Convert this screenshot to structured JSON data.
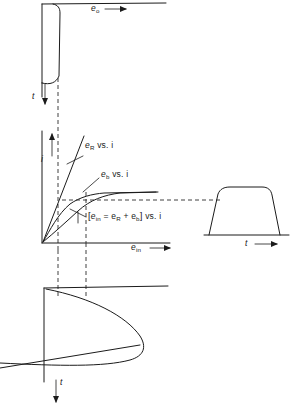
{
  "figure": {
    "background_color": "#ffffff",
    "ink_color": "#1b1b1b"
  },
  "panels": {
    "top_left": {
      "name": "output-voltage-waveform-panel",
      "description": "Flat-topped pulse waveform plotted with voltage to the right and time downward",
      "horizontal_axis_label": "e",
      "horizontal_axis_subscript": "o",
      "horizontal_axis_arrow": "right",
      "vertical_axis_label": "t",
      "vertical_axis_arrow": "down"
    },
    "center": {
      "name": "volt-ampere-characteristic-panel",
      "description": "Static volt-ampere characteristics, current vertical versus input voltage horizontal",
      "vertical_axis_label": "i",
      "vertical_axis_arrow": "up",
      "horizontal_axis_label": "e",
      "horizontal_axis_subscript": "in",
      "horizontal_axis_arrow": "right",
      "curves": [
        {
          "id": "e-r-curve",
          "label_text": "e",
          "label_subscript": "R",
          "label_suffix": " vs. i",
          "label_full": "e_R vs. i",
          "shape": "straight-line-through-origin",
          "description": "Linear resistive drop, steep slope"
        },
        {
          "id": "e-b-curve",
          "label_text": "e",
          "label_subscript": "b",
          "label_suffix": " vs. i",
          "label_full": "e_b vs. i",
          "shape": "saturating-knee-curve",
          "description": "Back-EMF characteristic rising then saturating to a horizontal plateau"
        },
        {
          "id": "e-in-sum-curve",
          "bracket_open": "[",
          "label_text": "e",
          "label_subscript": "in",
          "label_equals": " = e",
          "label_subscript_2": "R",
          "label_plus": " + e",
          "label_subscript_3": "b",
          "bracket_close": "]",
          "label_suffix": " vs. i",
          "label_full": "[e_in = e_R + e_b] vs. i",
          "shape": "summed-curve",
          "description": "Sum of the resistive and back-EMF characteristics"
        }
      ]
    },
    "right": {
      "name": "input-voltage-time-waveform-panel",
      "description": "Trapezoidal pulse of input voltage versus time",
      "horizontal_axis_label": "t",
      "horizontal_axis_arrow": "right",
      "waveform_shape": "trapezoidal-pulse"
    },
    "bottom_left": {
      "name": "current-time-waveform-panel",
      "description": "Sideways parabolic current lobe plotted with time downward",
      "vertical_axis_label": "t",
      "vertical_axis_arrow": "down",
      "waveform_shape": "sideways-parabolic-lobe"
    }
  },
  "projection_lines": {
    "name": "construction-dashed-lines",
    "style": "dashed",
    "items": [
      {
        "id": "vertical-projection-left",
        "orientation": "vertical",
        "description": "Links top-left waveform down through the characteristic plot to the bottom current waveform"
      },
      {
        "id": "vertical-projection-operating-point",
        "orientation": "vertical",
        "description": "Operating-point ordinate dropped from the characteristic curves to the bottom waveform"
      },
      {
        "id": "horizontal-projection-right",
        "orientation": "horizontal",
        "description": "Carries the current level across to the trapezoidal voltage-time waveform at the right"
      }
    ]
  }
}
